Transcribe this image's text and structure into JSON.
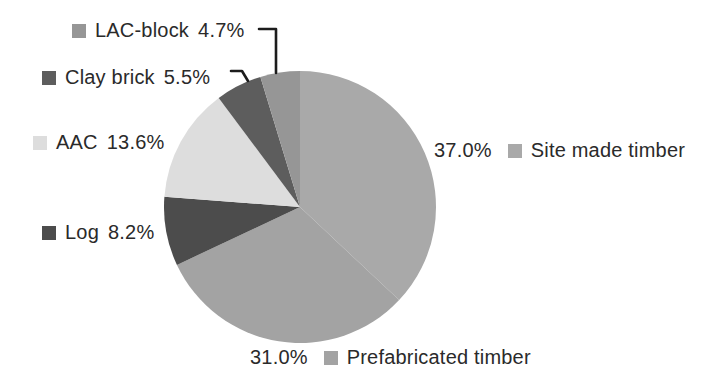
{
  "figure": {
    "background": "#ffffff",
    "text_color": "#2a2a2a",
    "callout_color": "#1c1c1c"
  },
  "chart_data": {
    "type": "pie",
    "title": "",
    "start_angle_deg": 0,
    "direction": "clockwise",
    "total": 100.0,
    "legend_position": "around-pie",
    "slices": [
      {
        "name": "Site made timber",
        "value": 37.0,
        "pct_label": "37.0%",
        "color": "#a9a9a9",
        "legend_side": "right",
        "callout": false
      },
      {
        "name": "Prefabricated timber",
        "value": 31.0,
        "pct_label": "31.0%",
        "color": "#a3a3a3",
        "legend_side": "bottom",
        "callout": false
      },
      {
        "name": "Log",
        "value": 8.2,
        "pct_label": "8.2%",
        "color": "#4c4c4c",
        "legend_side": "left",
        "callout": false
      },
      {
        "name": "AAC",
        "value": 13.6,
        "pct_label": "13.6%",
        "color": "#dddddd",
        "legend_side": "left",
        "callout": false
      },
      {
        "name": "Clay brick",
        "value": 5.5,
        "pct_label": "5.5%",
        "color": "#5d5d5d",
        "legend_side": "left",
        "callout": true
      },
      {
        "name": "LAC-block",
        "value": 4.7,
        "pct_label": "4.7%",
        "color": "#969696",
        "legend_side": "left",
        "callout": true
      }
    ]
  }
}
